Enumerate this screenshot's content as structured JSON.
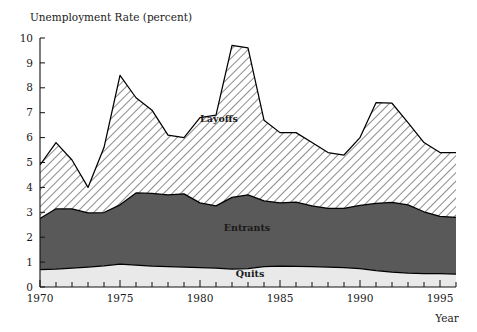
{
  "chart_data": {
    "type": "area",
    "stacked": true,
    "title": "Unemployment Rate (percent)",
    "xlabel": "Year",
    "ylabel": "Unemployment Rate (percent)",
    "ylim": [
      0,
      10
    ],
    "xlim": [
      1970,
      1996
    ],
    "grid": false,
    "legend_position": "inline-annotations",
    "y_ticks": [
      0,
      1,
      2,
      3,
      4,
      5,
      6,
      7,
      8,
      9,
      10
    ],
    "y_tick_labels": [
      "0",
      "1",
      "2",
      "3",
      "4",
      "5",
      "6",
      "7",
      "8",
      "9",
      "10"
    ],
    "x_ticks": [
      1970,
      1971,
      1972,
      1973,
      1974,
      1975,
      1976,
      1977,
      1978,
      1979,
      1980,
      1981,
      1982,
      1983,
      1984,
      1985,
      1986,
      1987,
      1988,
      1989,
      1990,
      1991,
      1992,
      1993,
      1994,
      1995,
      1996
    ],
    "x_tick_labels_major": [
      "1970",
      "1975",
      "1980",
      "1985",
      "1990",
      "1995"
    ],
    "x_major_tick_years": [
      1970,
      1975,
      1980,
      1985,
      1990,
      1995
    ],
    "x": [
      1970,
      1971,
      1972,
      1973,
      1974,
      1975,
      1976,
      1977,
      1978,
      1979,
      1980,
      1981,
      1982,
      1983,
      1984,
      1985,
      1986,
      1987,
      1988,
      1989,
      1990,
      1991,
      1992,
      1993,
      1994,
      1995,
      1996
    ],
    "series": [
      {
        "name": "Quits",
        "label": "Quits",
        "color": "#e9e9e9",
        "pattern": "solid-light",
        "values": [
          0.7,
          0.72,
          0.76,
          0.8,
          0.85,
          0.92,
          0.88,
          0.84,
          0.82,
          0.8,
          0.78,
          0.76,
          0.72,
          0.74,
          0.82,
          0.84,
          0.83,
          0.82,
          0.8,
          0.78,
          0.74,
          0.66,
          0.6,
          0.56,
          0.54,
          0.54,
          0.52
        ]
      },
      {
        "name": "Entrants",
        "label": "Entrants",
        "color": "#595959",
        "pattern": "solid-dark",
        "values": [
          2.05,
          2.42,
          2.38,
          2.18,
          2.14,
          2.38,
          2.9,
          2.92,
          2.88,
          2.94,
          2.6,
          2.5,
          2.88,
          2.96,
          2.64,
          2.54,
          2.58,
          2.44,
          2.36,
          2.38,
          2.54,
          2.7,
          2.8,
          2.74,
          2.48,
          2.3,
          2.28
        ]
      },
      {
        "name": "Layoffs",
        "label": "Layoffs",
        "color": "#ffffff",
        "pattern": "diagonal-hatch",
        "values": [
          2.15,
          2.66,
          1.96,
          1.02,
          2.61,
          5.2,
          3.82,
          3.34,
          2.4,
          2.26,
          3.42,
          3.64,
          6.1,
          5.9,
          3.24,
          2.82,
          2.79,
          2.54,
          2.24,
          2.14,
          2.72,
          4.04,
          3.98,
          3.3,
          2.78,
          2.56,
          2.6
        ]
      }
    ],
    "cumulative_totals": [
      4.9,
      5.8,
      5.1,
      4.0,
      5.6,
      8.5,
      7.6,
      7.1,
      6.1,
      6.0,
      6.8,
      6.9,
      9.7,
      9.6,
      6.7,
      6.22,
      6.2,
      5.8,
      5.4,
      5.3,
      6.0,
      7.4,
      7.38,
      6.6,
      5.8,
      5.4,
      5.4
    ]
  },
  "annotations": {
    "layoffs": "Layoffs",
    "entrants": "Entrants",
    "quits": "Quits"
  },
  "colors": {
    "layoffs_fill": "#ffffff",
    "entrants_fill": "#595959",
    "quits_fill": "#e9e9e9",
    "outline": "#000000",
    "axis": "#111111",
    "text": "#1a1a1a"
  }
}
